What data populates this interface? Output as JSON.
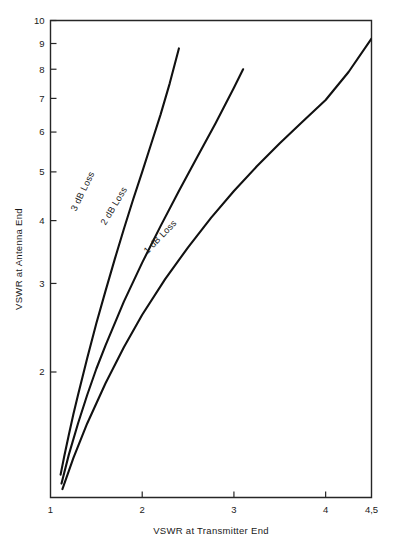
{
  "chart_data": {
    "type": "line",
    "title": "",
    "xlabel": "VSWR at Transmitter End",
    "ylabel": "VSWR at Antenna End",
    "xlim": [
      1,
      4.5
    ],
    "ylim": [
      1,
      10
    ],
    "xscale": "linear",
    "yscale": "log",
    "grid": false,
    "legend_position": "inline-curve-labels",
    "xticks": [
      {
        "value": 1,
        "label": "1"
      },
      {
        "value": 2,
        "label": "2"
      },
      {
        "value": 3,
        "label": "3"
      },
      {
        "value": 4,
        "label": "4"
      },
      {
        "value": 4.5,
        "label": "4,5"
      }
    ],
    "yticks": [
      {
        "value": 10,
        "label": "10"
      },
      {
        "value": 9,
        "label": "9"
      },
      {
        "value": 8,
        "label": "8"
      },
      {
        "value": 7,
        "label": "7"
      },
      {
        "value": 6,
        "label": "6"
      },
      {
        "value": 5,
        "label": "5"
      },
      {
        "value": 4,
        "label": "4"
      },
      {
        "value": 3,
        "label": "3"
      },
      {
        "value": 2,
        "label": "2"
      }
    ],
    "series": [
      {
        "name": "3 dB Loss",
        "label": "3 dB Loss",
        "loss_db": 3,
        "label_rotation_deg": 64,
        "label_x": 1.38,
        "label_y": 4.55,
        "x": [
          1.11,
          1.15,
          1.2,
          1.25,
          1.3,
          1.4,
          1.5,
          1.6,
          1.7,
          1.8,
          1.9,
          2.0,
          2.1,
          2.2,
          2.3,
          2.4
        ],
        "y": [
          1.25,
          1.36,
          1.5,
          1.65,
          1.8,
          2.13,
          2.5,
          2.9,
          3.35,
          3.85,
          4.4,
          5.0,
          5.7,
          6.5,
          7.5,
          8.8
        ]
      },
      {
        "name": "2 dB Loss",
        "label": "2 dB Loss",
        "loss_db": 2,
        "label_rotation_deg": 59,
        "label_x": 1.72,
        "label_y": 4.25,
        "x": [
          1.12,
          1.2,
          1.3,
          1.4,
          1.5,
          1.6,
          1.8,
          2.0,
          2.2,
          2.4,
          2.6,
          2.8,
          3.0,
          3.1
        ],
        "y": [
          1.2,
          1.37,
          1.58,
          1.8,
          2.03,
          2.26,
          2.76,
          3.3,
          3.9,
          4.58,
          5.35,
          6.25,
          7.35,
          8.0
        ]
      },
      {
        "name": "1 dB Loss",
        "label": "1 dB Loss",
        "loss_db": 1,
        "label_rotation_deg": 46,
        "label_x": 2.22,
        "label_y": 3.68,
        "x": [
          1.13,
          1.25,
          1.4,
          1.6,
          1.8,
          2.0,
          2.25,
          2.5,
          2.75,
          3.0,
          3.25,
          3.5,
          3.75,
          4.0,
          4.25,
          4.5
        ],
        "y": [
          1.17,
          1.35,
          1.58,
          1.9,
          2.24,
          2.6,
          3.06,
          3.54,
          4.05,
          4.58,
          5.13,
          5.7,
          6.3,
          6.95,
          7.9,
          9.2
        ]
      }
    ]
  },
  "axes": {
    "x_title": "VSWR at Transmitter End",
    "y_title": "VSWR at Antenna End"
  },
  "colors": {
    "curve": "#111111",
    "frame": "#262626",
    "text": "#1a1a1a",
    "background": "#ffffff"
  }
}
